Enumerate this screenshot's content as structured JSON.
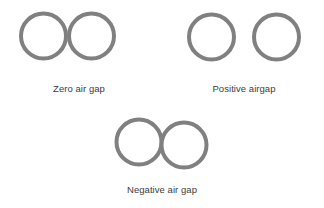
{
  "figure": {
    "background_color": "#ffffff",
    "stroke_color": "#808080",
    "fill_color": "#ffffff",
    "text_color": "#3c3c3c",
    "stroke_width": 4,
    "title": ""
  },
  "groups": [
    {
      "name": "zero-air-gap",
      "caption": "Zero air gap",
      "caption_x": 79,
      "caption_y": 83,
      "relationship": "tangent",
      "gap": 0,
      "circles": [
        {
          "cx": 43.5,
          "cy": 36,
          "r": 22.5
        },
        {
          "cx": 91.5,
          "cy": 36,
          "r": 22.5
        }
      ]
    },
    {
      "name": "positive-airgap",
      "caption": "Positive airgap",
      "caption_x": 244,
      "caption_y": 83,
      "relationship": "separated",
      "gap": 14,
      "circles": [
        {
          "cx": 211.5,
          "cy": 37,
          "r": 22.5
        },
        {
          "cx": 276.5,
          "cy": 37,
          "r": 22.5
        }
      ]
    },
    {
      "name": "negative-air-gap",
      "caption": "Negative air gap",
      "caption_x": 162,
      "caption_y": 184,
      "relationship": "overlapping",
      "gap": -14,
      "circles": [
        {
          "cx": 139,
          "cy": 142,
          "r": 22.5
        },
        {
          "cx": 184,
          "cy": 145,
          "r": 22.5
        }
      ]
    }
  ]
}
